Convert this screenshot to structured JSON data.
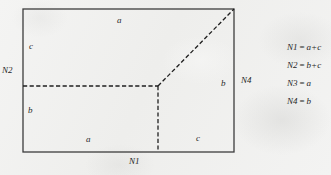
{
  "figure": {
    "region_labels": [
      {
        "id": "top-edge-a",
        "text": "a",
        "x": 117,
        "y": 16
      },
      {
        "id": "upper-left-c",
        "text": "c",
        "x": 29,
        "y": 42
      },
      {
        "id": "lower-left-b",
        "text": "b",
        "x": 28,
        "y": 106
      },
      {
        "id": "bottom-left-a",
        "text": "a",
        "x": 86,
        "y": 135
      },
      {
        "id": "bottom-right-c",
        "text": "c",
        "x": 196,
        "y": 134
      },
      {
        "id": "right-edge-b",
        "text": "b",
        "x": 221,
        "y": 79
      }
    ],
    "node_labels": [
      {
        "id": "N2",
        "text": "N2",
        "x": 2,
        "y": 66
      },
      {
        "id": "N4",
        "text": "N4",
        "x": 241,
        "y": 76
      },
      {
        "id": "N1",
        "text": "N1",
        "x": 129,
        "y": 157
      }
    ],
    "geometry": {
      "rect": {
        "left": 23,
        "top": 9,
        "right": 234,
        "bottom": 152
      },
      "junction": {
        "x": 158,
        "y": 86
      },
      "solid_color": "#3c3c3c",
      "dashed_color": "#1f1f1f"
    }
  },
  "legend": {
    "items": [
      {
        "name": "N1",
        "eq": "=",
        "value": "a+c"
      },
      {
        "name": "N2",
        "eq": "=",
        "value": "b+c"
      },
      {
        "name": "N3",
        "eq": "=",
        "value": "a"
      },
      {
        "name": "N4",
        "eq": "=",
        "value": "b"
      }
    ]
  }
}
